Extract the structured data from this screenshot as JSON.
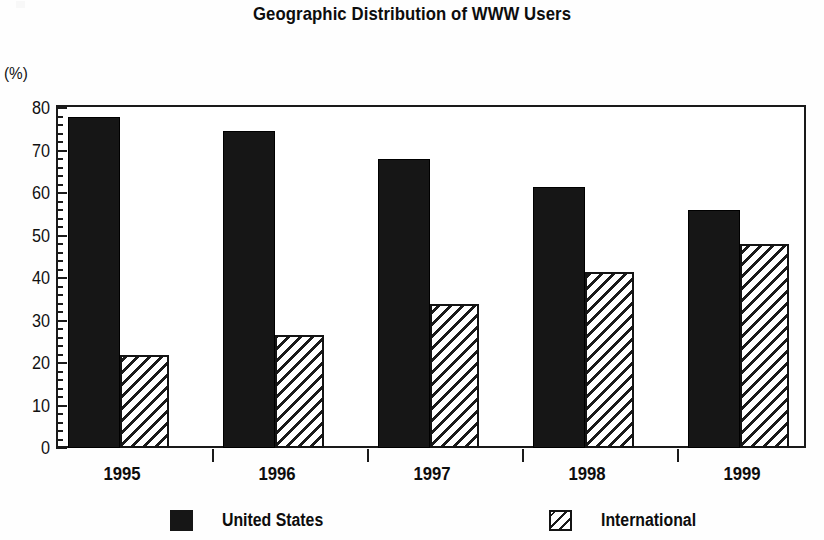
{
  "chart_data": {
    "type": "bar",
    "title": "Geographic Distribution of WWW Users",
    "xlabel": "",
    "ylabel": "(%)",
    "categories": [
      "1995",
      "1996",
      "1997",
      "1998",
      "1999"
    ],
    "series": [
      {
        "name": "United States",
        "values": [
          78,
          74.5,
          68,
          61.5,
          56
        ],
        "fill": "solid-black",
        "color": "#161616"
      },
      {
        "name": "International",
        "values": [
          22,
          26.5,
          34,
          41.5,
          48
        ],
        "fill": "diagonal-hatch",
        "color": "#ffffff"
      }
    ],
    "ylim": [
      0,
      80
    ],
    "ytick_labels": [
      "0",
      "10",
      "20",
      "30",
      "40",
      "50",
      "60",
      "70",
      "80"
    ],
    "ytick_values": [
      0,
      10,
      20,
      30,
      40,
      50,
      60,
      70,
      80
    ],
    "yminor_step": 2,
    "grid": false,
    "legend_position": "bottom",
    "legend": [
      "United States",
      "International"
    ]
  },
  "axis": {
    "y_unit_label": "(%)"
  },
  "legend": {
    "items": [
      {
        "label": "United States",
        "swatch": "solid-black-swatch"
      },
      {
        "label": "International",
        "swatch": "hatched-swatch"
      }
    ]
  }
}
